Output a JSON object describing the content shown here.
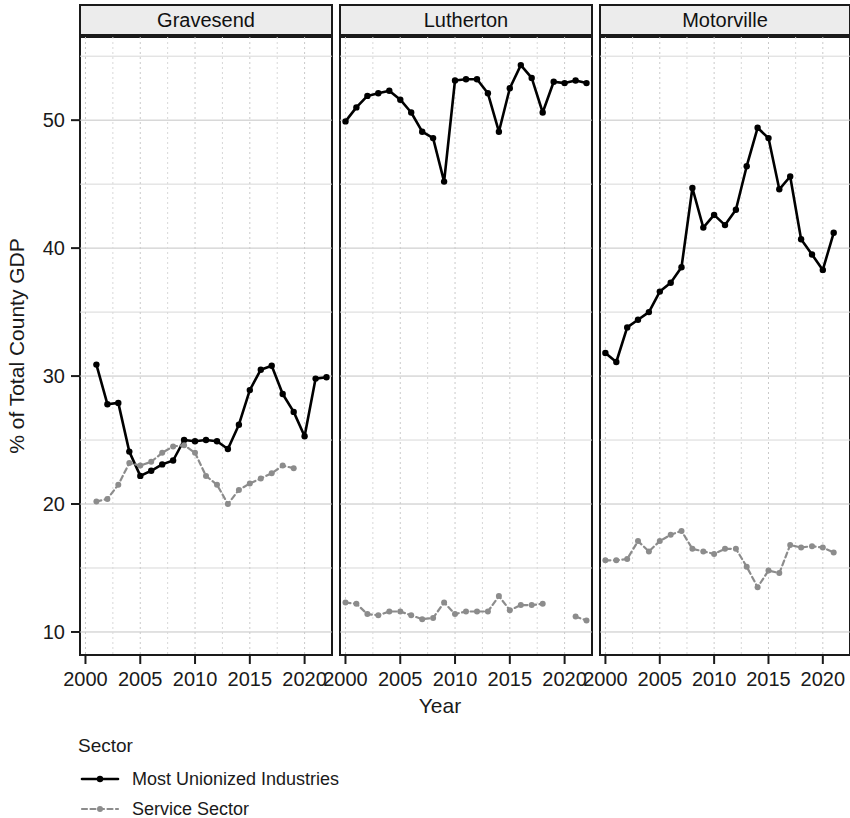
{
  "chart_data": {
    "type": "line",
    "title": "",
    "xlabel": "Year",
    "ylabel": "% of Total County GDP",
    "facet_by": "county",
    "facets": [
      "Gravesend",
      "Lutherton",
      "Motorville"
    ],
    "xlim": [
      1999.5,
      2022.5
    ],
    "ylim": [
      8.2,
      56.5
    ],
    "xticks": [
      2000,
      2005,
      2010,
      2015,
      2020
    ],
    "xtick_labels": [
      "2000",
      "2005",
      "2010",
      "2015",
      "2020"
    ],
    "yticks": [
      10,
      20,
      30,
      40,
      50
    ],
    "ytick_labels": [
      "10",
      "20",
      "30",
      "40",
      "50"
    ],
    "minor_yticks": [
      15,
      25,
      35,
      45,
      55
    ],
    "minor_xticks": [
      2002.5,
      2007.5,
      2012.5,
      2017.5,
      2022.5
    ],
    "grid": true,
    "legend_title": "Sector",
    "legend_position": "bottom-left",
    "series": [
      {
        "name": "Most Unionized Industries",
        "color": "#000000",
        "linestyle": "solid",
        "marker": "circle",
        "panels": [
          {
            "facet": "Gravesend",
            "x": [
              2001,
              2002,
              2003,
              2004,
              2005,
              2006,
              2007,
              2008,
              2009,
              2010,
              2011,
              2012,
              2013,
              2014,
              2015,
              2016,
              2017,
              2018,
              2019,
              2020,
              2021,
              2022
            ],
            "y": [
              30.9,
              27.8,
              27.9,
              24.1,
              22.2,
              22.6,
              23.1,
              23.4,
              25.0,
              24.9,
              25.0,
              24.9,
              24.3,
              26.2,
              28.9,
              30.5,
              30.8,
              28.6,
              27.2,
              25.3,
              29.8,
              29.9
            ]
          },
          {
            "facet": "Lutherton",
            "x": [
              2000,
              2001,
              2002,
              2003,
              2004,
              2005,
              2006,
              2007,
              2008,
              2009,
              2010,
              2011,
              2012,
              2013,
              2014,
              2015,
              2016,
              2017,
              2018,
              2019,
              2020,
              2021,
              2022
            ],
            "y": [
              49.9,
              51.0,
              51.9,
              52.1,
              52.3,
              51.6,
              50.6,
              49.1,
              48.6,
              45.2,
              53.1,
              53.2,
              53.2,
              52.1,
              49.1,
              52.5,
              54.3,
              53.3,
              50.6,
              53.0,
              52.9,
              53.1,
              52.9
            ]
          },
          {
            "facet": "Motorville",
            "x": [
              2000,
              2001,
              2002,
              2003,
              2004,
              2005,
              2006,
              2007,
              2008,
              2009,
              2010,
              2011,
              2012,
              2013,
              2014,
              2015,
              2016,
              2017,
              2018,
              2019,
              2020,
              2021
            ],
            "y": [
              31.8,
              31.1,
              33.8,
              34.4,
              35.0,
              36.6,
              37.3,
              38.5,
              44.7,
              41.6,
              42.6,
              41.8,
              43.0,
              46.4,
              49.4,
              48.6,
              44.6,
              45.6,
              40.7,
              39.5,
              38.3,
              41.2
            ]
          }
        ]
      },
      {
        "name": "Service Sector",
        "color": "#8c8c8c",
        "linestyle": "dashed",
        "marker": "circle",
        "panels": [
          {
            "facet": "Gravesend",
            "x": [
              2001,
              2002,
              2003,
              2004,
              2005,
              2006,
              2007,
              2008,
              2009,
              2010,
              2011,
              2012,
              2013,
              2014,
              2015,
              2016,
              2017,
              2018,
              2019
            ],
            "y": [
              20.2,
              20.4,
              21.5,
              23.2,
              23.0,
              23.3,
              24.0,
              24.5,
              24.6,
              24.0,
              22.2,
              21.5,
              20.0,
              21.1,
              21.6,
              22.0,
              22.4,
              23.0,
              22.8
            ]
          },
          {
            "facet": "Lutherton",
            "x": [
              2000,
              2001,
              2002,
              2003,
              2004,
              2005,
              2006,
              2007,
              2008,
              2009,
              2010,
              2011,
              2012,
              2013,
              2014,
              2015,
              2016,
              2017,
              2018,
              2021,
              2022
            ],
            "y": [
              12.3,
              12.2,
              11.4,
              11.3,
              11.6,
              11.6,
              11.3,
              11.0,
              11.1,
              12.3,
              11.4,
              11.6,
              11.6,
              11.6,
              12.8,
              11.7,
              12.1,
              12.1,
              12.2,
              11.2,
              10.9
            ]
          },
          {
            "facet": "Motorville",
            "x": [
              2000,
              2001,
              2002,
              2003,
              2004,
              2005,
              2006,
              2007,
              2008,
              2009,
              2010,
              2011,
              2012,
              2013,
              2014,
              2015,
              2016,
              2017,
              2018,
              2019,
              2020,
              2021
            ],
            "y": [
              15.6,
              15.6,
              15.7,
              17.1,
              16.3,
              17.1,
              17.6,
              17.9,
              16.5,
              16.3,
              16.1,
              16.5,
              16.5,
              15.1,
              13.5,
              14.8,
              14.6,
              16.8,
              16.6,
              16.7,
              16.6,
              16.2
            ]
          }
        ]
      }
    ]
  },
  "legend": {
    "title": "Sector",
    "entries": [
      {
        "label": "Most Unionized Industries",
        "color": "#000000",
        "style": "solid"
      },
      {
        "label": "Service Sector",
        "color": "#8c8c8c",
        "style": "dashed"
      }
    ]
  },
  "axes": {
    "y_title": "% of Total County GDP",
    "x_title": "Year"
  },
  "panels": [
    {
      "title": "Gravesend"
    },
    {
      "title": "Lutherton"
    },
    {
      "title": "Motorville"
    }
  ]
}
